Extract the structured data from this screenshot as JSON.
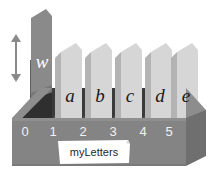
{
  "diagram": {
    "title": "myLetters",
    "variable_label": "myLetters",
    "height_arrow_name": "height-indicator-arrow",
    "indices": [
      "0",
      "1",
      "2",
      "3",
      "4",
      "5"
    ],
    "cards": [
      {
        "index": "0",
        "letter": "w",
        "kind": "tall-highlighted"
      },
      {
        "index": "1",
        "letter": "a",
        "kind": "normal"
      },
      {
        "index": "2",
        "letter": "b",
        "kind": "normal"
      },
      {
        "index": "3",
        "letter": "c",
        "kind": "normal"
      },
      {
        "index": "4",
        "letter": "d",
        "kind": "normal"
      },
      {
        "index": "5",
        "letter": "e",
        "kind": "normal"
      }
    ],
    "colors": {
      "box_front": "#848484",
      "box_top": "#8d8d8d",
      "box_right": "#6f6f6f",
      "box_interior_shadow": "#3a3a3a",
      "card_face": "#d6d6d6",
      "card_shadow": "#9a9a9a",
      "tall_card_face": "#8a8a8a",
      "tall_card_shadow": "#6a6a6a",
      "index_text": "#f2f2f2",
      "letter_text": "#1a1a1a",
      "w_text": "#ffffff",
      "label_bg": "#ffffff",
      "label_text": "#1f1f1f",
      "arrow": "#8a8a8a",
      "background": "#ffffff"
    }
  }
}
